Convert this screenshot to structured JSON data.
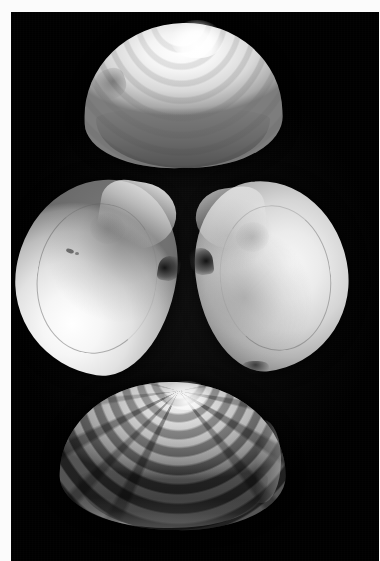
{
  "image": {
    "kind": "photograph",
    "subject": "clam-shell-specimen-plate",
    "orientation": "portrait",
    "width_px": 380,
    "height_px": 561,
    "palette": {
      "background_field": "#000000",
      "print_margin": "#fbfbfb",
      "shell_highlight": "#ffffff",
      "shell_midtone": "#b4b4b4",
      "shell_shadow": "#2c2c2c"
    },
    "plate": {
      "margin_left_px": 11,
      "margin_top_px": 12,
      "field_width_px": 368,
      "field_height_px": 549
    }
  },
  "specimens": [
    {
      "id": "top",
      "label": "Top valve — exterior view",
      "view": "exterior",
      "description": "Triangular-ovate valve, pale cream to white, fine concentric growth ribs radiating from a pointed umbo at top centre; a shallow lunule notch indents the left shoulder.",
      "tone": "bright-white",
      "position": {
        "left_px": 84,
        "top_px": 23,
        "width_px": 198,
        "height_px": 145
      }
    },
    {
      "id": "middle-left",
      "label": "Middle left valve — interior view",
      "view": "interior",
      "description": "Concave nacreous interior, brightest along the lower-left ventral margin, with a faint arcing pallial line, an adductor muscle scar near the upper centre and two small dark specks; the dark hinge beak points right toward the facing valve.",
      "tone": "bright-white",
      "position": {
        "left_px": 16,
        "top_px": 178,
        "width_px": 160,
        "height_px": 196
      }
    },
    {
      "id": "middle-right",
      "label": "Middle right valve — interior view",
      "view": "interior",
      "description": "Mirror-image concave interior, slightly greyer than its partner, showing a faint pallial line loop and mottled muscle scars; its dark hinge beak points left, nearly meeting the left valve at the centre of the plate.",
      "tone": "mid-grey",
      "position": {
        "left_px": 196,
        "top_px": 180,
        "width_px": 152,
        "height_px": 190
      }
    },
    {
      "id": "bottom",
      "label": "Bottom valve — exterior view",
      "view": "exterior",
      "description": "Broad fan-shaped valve with bold, closely spaced concentric growth ridges and dark eroded radial streaks; a bright ventral rim catches the light along the lower margin.",
      "tone": "dark-grey-banded",
      "position": {
        "left_px": 60,
        "top_px": 382,
        "width_px": 226,
        "height_px": 148
      }
    }
  ],
  "composition": {
    "arrangement": "three rows — single valve above, opposed pair in the centre, single valve below",
    "lighting": "single soft key light from upper-left against a black backdrop",
    "count": 4
  }
}
